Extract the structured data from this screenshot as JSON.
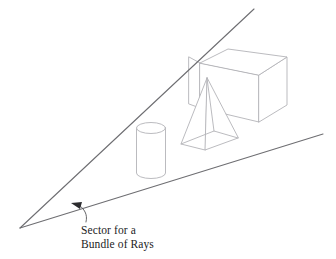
{
  "figure": {
    "type": "line-diagram",
    "title": "",
    "background_color": "#ffffff",
    "caption": {
      "line1": "Sector for a",
      "line2": "Bundle of Rays"
    },
    "annotation": {
      "arrow_label": "Sector for a Bundle of Rays",
      "arrow_target": "lower ray boundary",
      "arrow_direction": "up-left"
    },
    "colors": {
      "ray_stroke": "#6e6e72",
      "object_stroke": "#b3b3b8",
      "leader_stroke": "#555558",
      "arrow_fill": "#2b2b2e",
      "text": "#1c1c1e",
      "background": "#ffffff"
    },
    "geometry": {
      "apex": {
        "x": 20,
        "y": 228
      },
      "upper_ray_end": {
        "x": 254,
        "y": 9
      },
      "lower_ray_end": {
        "x": 323,
        "y": 134
      },
      "sector_label_anchor": {
        "x": 79,
        "y": 204
      }
    },
    "objects": [
      {
        "name": "box",
        "kind": "cuboid",
        "label": "box",
        "top_face": "200,63 228,49 287,57 259,75",
        "front_face": "200,63 259,75 259,122 200,108",
        "right_face": "259,75 287,57 287,105 259,122",
        "left_tab": "189,57 200,63 200,108 189,104"
      },
      {
        "name": "pyramid",
        "kind": "pyramid",
        "label": "pyramid",
        "apex": {
          "x": 207,
          "y": 78
        },
        "base": "181,144 205,150 238,138 214,131"
      },
      {
        "name": "cylinder",
        "kind": "cylinder",
        "label": "cylinder",
        "center_x": 151,
        "top_y": 128,
        "bottom_y": 173,
        "radius_x": 14.5,
        "radius_y": 5.5
      }
    ]
  }
}
